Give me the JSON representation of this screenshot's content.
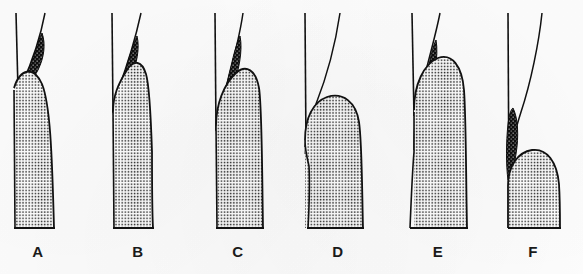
{
  "figure": {
    "background_color": "#fdfdfd",
    "ink_color": "#111111",
    "stipple_color": "#2a2a2a",
    "deposit_color": "#0d0d0d",
    "width": 583,
    "height": 274,
    "caption_ghost": "partial cut-off caption line at page edge, illegible"
  },
  "panels": [
    {
      "id": "A",
      "label": "A",
      "label_x": 38,
      "label_y": 243,
      "tooth_surface_line": "vertical",
      "gingival_margin_line": "angled",
      "deposit_present": true,
      "deposit_position": "supragingival-wedge",
      "tooth_body_profile": "tall-rounded-taper",
      "tooth_body_peak_y": 88
    },
    {
      "id": "B",
      "label": "B",
      "label_x": 138,
      "label_y": 243,
      "tooth_surface_line": "vertical",
      "gingival_margin_line": "angled",
      "deposit_present": true,
      "deposit_position": "marginal-wedge",
      "tooth_body_profile": "pointed-peak-with-notch",
      "tooth_body_peak_y": 66
    },
    {
      "id": "C",
      "label": "C",
      "label_x": 238,
      "label_y": 243,
      "tooth_surface_line": "vertical",
      "gingival_margin_line": "angled",
      "deposit_present": true,
      "deposit_position": "elongated-subgingival",
      "tooth_body_profile": "tall-rounded-crest",
      "tooth_body_peak_y": 72
    },
    {
      "id": "D",
      "label": "D",
      "label_x": 338,
      "label_y": 243,
      "tooth_surface_line": "vertical",
      "gingival_margin_line": "curved-flaring",
      "deposit_present": true,
      "deposit_position": "small-pocket-nodule",
      "tooth_body_profile": "bulbous-dome-with-left-notch",
      "tooth_body_peak_y": 97
    },
    {
      "id": "E",
      "label": "E",
      "label_x": 438,
      "label_y": 243,
      "tooth_surface_line": "vertical",
      "gingival_margin_line": "angled",
      "deposit_present": true,
      "deposit_position": "long-band-deep-pocket",
      "tooth_body_profile": "tallest-rounded-dome",
      "tooth_body_peak_y": 58
    },
    {
      "id": "F",
      "label": "F",
      "label_x": 533,
      "label_y": 243,
      "tooth_surface_line": "vertical",
      "gingival_margin_line": "curved-flaring",
      "deposit_present": true,
      "deposit_position": "detached-band-above-crest",
      "tooth_body_profile": "low-separated-dome",
      "tooth_body_peak_y": 150
    }
  ]
}
